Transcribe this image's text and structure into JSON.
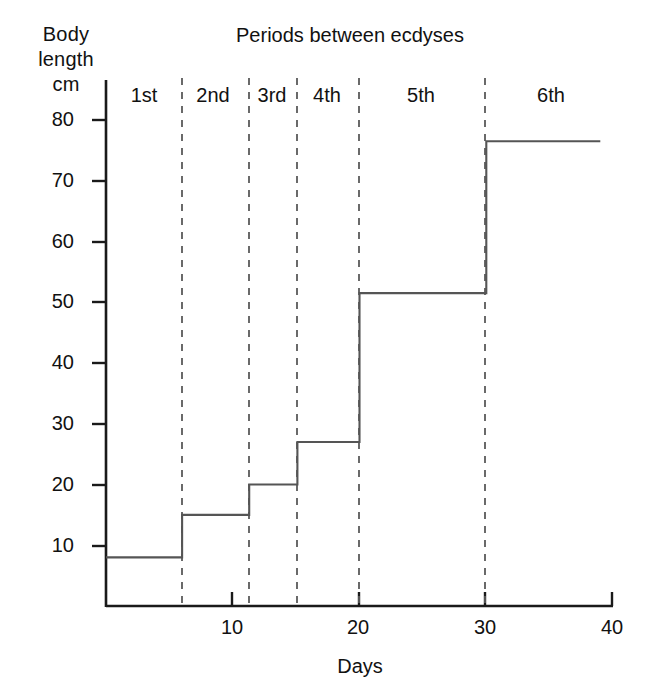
{
  "chart_data": {
    "type": "line",
    "title": "Periods between ecdyses",
    "xlabel": "Days",
    "ylabel_lines": [
      "Body",
      "length",
      "cm"
    ],
    "xlim": [
      0,
      40
    ],
    "ylim": [
      0,
      84
    ],
    "xticks": [
      10,
      20,
      30,
      40
    ],
    "xtick_labels": [
      "10",
      "20",
      "30",
      "40"
    ],
    "yticks": [
      10,
      20,
      30,
      40,
      50,
      60,
      70,
      80
    ],
    "ytick_labels": [
      "10",
      "20",
      "30",
      "40",
      "50",
      "60",
      "70",
      "80"
    ],
    "grid": false,
    "legend": "none",
    "series": [
      {
        "name": "Body length",
        "style": "step-post",
        "x": [
          0,
          6,
          6,
          11.3,
          11.3,
          15.1,
          15.1,
          20,
          20,
          30,
          30,
          39
        ],
        "y": [
          8,
          8,
          15,
          15,
          20,
          20,
          27,
          27,
          51.5,
          51.5,
          76.5,
          76.5
        ]
      }
    ],
    "instars": [
      {
        "label": "1st",
        "start_day": 0,
        "end_day": 6,
        "body_length": 8
      },
      {
        "label": "2nd",
        "start_day": 6,
        "end_day": 11.3,
        "body_length": 15
      },
      {
        "label": "3rd",
        "start_day": 11.3,
        "end_day": 15.1,
        "body_length": 20
      },
      {
        "label": "4th",
        "start_day": 15.1,
        "end_day": 20,
        "body_length": 27
      },
      {
        "label": "5th",
        "start_day": 20,
        "end_day": 30,
        "body_length": 51.5
      },
      {
        "label": "6th",
        "start_day": 30,
        "end_day": 39,
        "body_length": 76.5
      }
    ],
    "ecdysis_days": [
      6,
      11.3,
      15.1,
      20,
      30
    ],
    "colors": {
      "background": "#ffffff",
      "axis": "#1a1a1a",
      "line": "#555555",
      "divider": "#666666",
      "text": "#111111"
    }
  }
}
